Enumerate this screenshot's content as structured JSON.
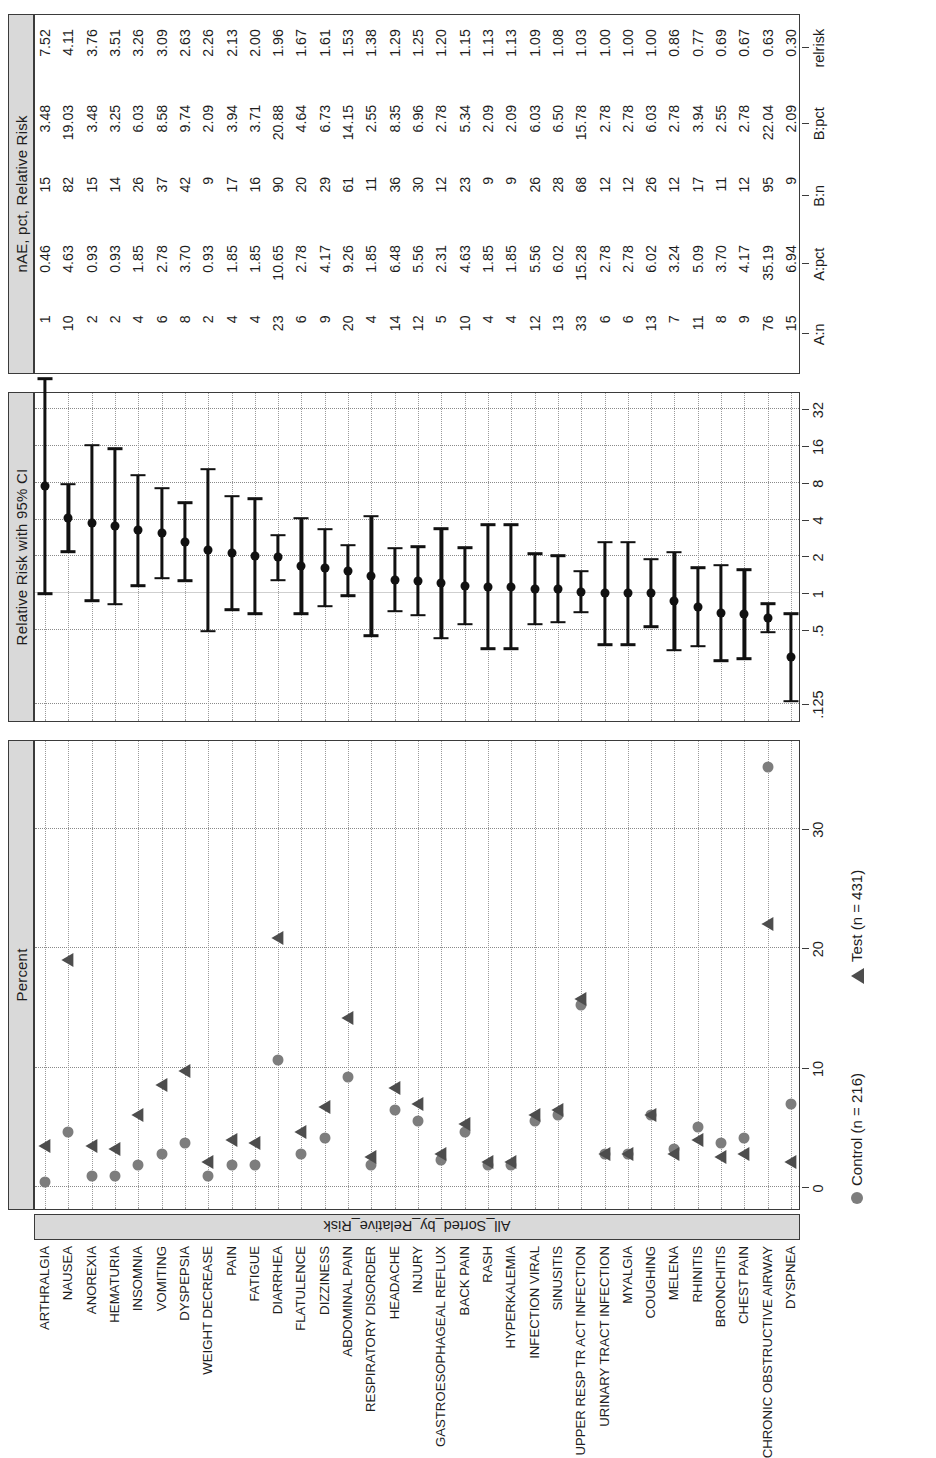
{
  "figure": {
    "panels": [
      {
        "id": "percent",
        "title": "Percent"
      },
      {
        "id": "relrisk",
        "title": "Relative Risk with 95% CI"
      },
      {
        "id": "table",
        "title": "nAE, pct, Relative Risk"
      }
    ],
    "strip_label": "All_Sorted_by_Relative_Risk",
    "legend": [
      {
        "symbol": "circle-marker",
        "label": "Control (n = 216)",
        "color": "#7d7d7d"
      },
      {
        "symbol": "triangle-marker",
        "label": "Test (n = 431)",
        "color": "#4d4d4d"
      }
    ]
  },
  "chart_data": {
    "type": "scatter",
    "title": "nAE, pct, Relative Risk",
    "panel_titles": [
      "Percent",
      "Relative Risk with 95% CI",
      "nAE, pct, Relative Risk"
    ],
    "ylabel": "All_Sorted_by_Relative_Risk",
    "legend": [
      "Control (n = 216)",
      "Test (n = 431)"
    ],
    "legend_position": "bottom-left",
    "grid": true,
    "percent_axis": {
      "label": "Percent",
      "ticks": [
        0,
        10,
        20,
        30
      ],
      "tick_labels": [
        "0",
        "10",
        "20",
        "30"
      ],
      "lim": [
        -1.5,
        37
      ]
    },
    "relrisk_axis": {
      "label": "Relative Risk with 95% CI",
      "scale": "log2",
      "ticks": [
        0.125,
        0.5,
        1,
        2,
        4,
        8,
        16,
        32
      ],
      "tick_labels": [
        ".125",
        ".5",
        "1",
        "2",
        "4",
        "8",
        "16",
        "32"
      ],
      "refline": 1
    },
    "table_headers": [
      "A:n",
      "A:pct",
      "B:n",
      "B:pct",
      "relrisk"
    ],
    "categories": [
      "ARTHRALGIA",
      "NAUSEA",
      "ANOREXIA",
      "HEMATURIA",
      "INSOMNIA",
      "VOMITING",
      "DYSPEPSIA",
      "WEIGHT DECREASE",
      "PAIN",
      "FATIGUE",
      "DIARRHEA",
      "FLATULENCE",
      "DIZZINESS",
      "ABDOMINAL PAIN",
      "RESPIRATORY DISORDER",
      "HEADACHE",
      "INJURY",
      "GASTROESOPHAGEAL REFLUX",
      "BACK PAIN",
      "RASH",
      "HYPERKALEMIA",
      "INFECTION VIRAL",
      "SINUSITIS",
      "UPPER RESP TR ACT INFECTION",
      "URINARY TRACT INFECTION",
      "MYALGIA",
      "COUGHING",
      "MELENA",
      "RHINITIS",
      "BRONCHITIS",
      "CHEST PAIN",
      "CHRONIC OBSTRUCTIVE AIRWAY",
      "DYSPNEA"
    ],
    "rows": [
      {
        "ae": "ARTHRALGIA",
        "a_n": 1,
        "a_pct": 0.46,
        "b_n": 15,
        "b_pct": 3.48,
        "relrisk": 7.52,
        "lcl": 0.99,
        "ucl": 56.6
      },
      {
        "ae": "NAUSEA",
        "a_n": 10,
        "a_pct": 4.63,
        "b_n": 82,
        "b_pct": 19.03,
        "relrisk": 4.11,
        "lcl": 2.18,
        "ucl": 7.75
      },
      {
        "ae": "ANOREXIA",
        "a_n": 2,
        "a_pct": 0.93,
        "b_n": 15,
        "b_pct": 3.48,
        "relrisk": 3.76,
        "lcl": 0.87,
        "ucl": 16.2
      },
      {
        "ae": "HEMATURIA",
        "a_n": 2,
        "a_pct": 0.93,
        "b_n": 14,
        "b_pct": 3.25,
        "relrisk": 3.51,
        "lcl": 0.81,
        "ucl": 15.2
      },
      {
        "ae": "INSOMNIA",
        "a_n": 4,
        "a_pct": 1.85,
        "b_n": 26,
        "b_pct": 6.03,
        "relrisk": 3.26,
        "lcl": 1.15,
        "ucl": 9.22
      },
      {
        "ae": "VOMITING",
        "a_n": 6,
        "a_pct": 2.78,
        "b_n": 37,
        "b_pct": 8.58,
        "relrisk": 3.09,
        "lcl": 1.32,
        "ucl": 7.21
      },
      {
        "ae": "DYSPEPSIA",
        "a_n": 8,
        "a_pct": 3.7,
        "b_n": 42,
        "b_pct": 9.74,
        "relrisk": 2.63,
        "lcl": 1.26,
        "ucl": 5.5
      },
      {
        "ae": "WEIGHT DECREASE",
        "a_n": 2,
        "a_pct": 0.93,
        "b_n": 9,
        "b_pct": 2.09,
        "relrisk": 2.26,
        "lcl": 0.49,
        "ucl": 10.3
      },
      {
        "ae": "PAIN",
        "a_n": 4,
        "a_pct": 1.85,
        "b_n": 17,
        "b_pct": 3.94,
        "relrisk": 2.13,
        "lcl": 0.73,
        "ucl": 6.22
      },
      {
        "ae": "FATIGUE",
        "a_n": 4,
        "a_pct": 1.85,
        "b_n": 16,
        "b_pct": 3.71,
        "relrisk": 2.0,
        "lcl": 0.68,
        "ucl": 5.9
      },
      {
        "ae": "DIARRHEA",
        "a_n": 23,
        "a_pct": 10.65,
        "b_n": 90,
        "b_pct": 20.88,
        "relrisk": 1.96,
        "lcl": 1.28,
        "ucl": 2.99
      },
      {
        "ae": "FLATULENCE",
        "a_n": 6,
        "a_pct": 2.78,
        "b_n": 20,
        "b_pct": 4.64,
        "relrisk": 1.67,
        "lcl": 0.68,
        "ucl": 4.1
      },
      {
        "ae": "DIZZINESS",
        "a_n": 9,
        "a_pct": 4.17,
        "b_n": 29,
        "b_pct": 6.73,
        "relrisk": 1.61,
        "lcl": 0.78,
        "ucl": 3.34
      },
      {
        "ae": "ABDOMINAL PAIN",
        "a_n": 20,
        "a_pct": 9.26,
        "b_n": 61,
        "b_pct": 14.15,
        "relrisk": 1.53,
        "lcl": 0.95,
        "ucl": 2.46
      },
      {
        "ae": "RESPIRATORY DISORDER",
        "a_n": 4,
        "a_pct": 1.85,
        "b_n": 11,
        "b_pct": 2.55,
        "relrisk": 1.38,
        "lcl": 0.45,
        "ucl": 4.26
      },
      {
        "ae": "HEADACHE",
        "a_n": 14,
        "a_pct": 6.48,
        "b_n": 36,
        "b_pct": 8.35,
        "relrisk": 1.29,
        "lcl": 0.71,
        "ucl": 2.33
      },
      {
        "ae": "INJURY",
        "a_n": 12,
        "a_pct": 5.56,
        "b_n": 30,
        "b_pct": 6.96,
        "relrisk": 1.25,
        "lcl": 0.66,
        "ucl": 2.39
      },
      {
        "ae": "GASTROESOPHAGEAL REFLUX",
        "a_n": 5,
        "a_pct": 2.31,
        "b_n": 12,
        "b_pct": 2.78,
        "relrisk": 1.2,
        "lcl": 0.43,
        "ucl": 3.36
      },
      {
        "ae": "BACK PAIN",
        "a_n": 10,
        "a_pct": 4.63,
        "b_n": 23,
        "b_pct": 5.34,
        "relrisk": 1.15,
        "lcl": 0.56,
        "ucl": 2.36
      },
      {
        "ae": "RASH",
        "a_n": 4,
        "a_pct": 1.85,
        "b_n": 9,
        "b_pct": 2.09,
        "relrisk": 1.13,
        "lcl": 0.35,
        "ucl": 3.62
      },
      {
        "ae": "HYPERKALEMIA",
        "a_n": 4,
        "a_pct": 1.85,
        "b_n": 9,
        "b_pct": 2.09,
        "relrisk": 1.13,
        "lcl": 0.35,
        "ucl": 3.62
      },
      {
        "ae": "INFECTION VIRAL",
        "a_n": 12,
        "a_pct": 5.56,
        "b_n": 26,
        "b_pct": 6.03,
        "relrisk": 1.09,
        "lcl": 0.56,
        "ucl": 2.1
      },
      {
        "ae": "SINUSITIS",
        "a_n": 13,
        "a_pct": 6.02,
        "b_n": 28,
        "b_pct": 6.5,
        "relrisk": 1.08,
        "lcl": 0.58,
        "ucl": 2.02
      },
      {
        "ae": "UPPER RESP TR ACT INFECTION",
        "a_n": 33,
        "a_pct": 15.28,
        "b_n": 68,
        "b_pct": 15.78,
        "relrisk": 1.03,
        "lcl": 0.7,
        "ucl": 1.52
      },
      {
        "ae": "URINARY TRACT INFECTION",
        "a_n": 6,
        "a_pct": 2.78,
        "b_n": 12,
        "b_pct": 2.78,
        "relrisk": 1.0,
        "lcl": 0.38,
        "ucl": 2.62
      },
      {
        "ae": "MYALGIA",
        "a_n": 6,
        "a_pct": 2.78,
        "b_n": 12,
        "b_pct": 2.78,
        "relrisk": 1.0,
        "lcl": 0.38,
        "ucl": 2.62
      },
      {
        "ae": "COUGHING",
        "a_n": 13,
        "a_pct": 6.02,
        "b_n": 26,
        "b_pct": 6.03,
        "relrisk": 1.0,
        "lcl": 0.53,
        "ucl": 1.89
      },
      {
        "ae": "MELENA",
        "a_n": 7,
        "a_pct": 3.24,
        "b_n": 12,
        "b_pct": 2.78,
        "relrisk": 0.86,
        "lcl": 0.34,
        "ucl": 2.15
      },
      {
        "ae": "RHINITIS",
        "a_n": 11,
        "a_pct": 5.09,
        "b_n": 17,
        "b_pct": 3.94,
        "relrisk": 0.77,
        "lcl": 0.37,
        "ucl": 1.62
      },
      {
        "ae": "BRONCHITIS",
        "a_n": 8,
        "a_pct": 3.7,
        "b_n": 11,
        "b_pct": 2.55,
        "relrisk": 0.69,
        "lcl": 0.28,
        "ucl": 1.69
      },
      {
        "ae": "CHEST PAIN",
        "a_n": 9,
        "a_pct": 4.17,
        "b_n": 12,
        "b_pct": 2.78,
        "relrisk": 0.67,
        "lcl": 0.29,
        "ucl": 1.55
      },
      {
        "ae": "CHRONIC OBSTRUCTIVE AIRWAY",
        "a_n": 76,
        "a_pct": 35.19,
        "b_n": 95,
        "b_pct": 22.04,
        "relrisk": 0.63,
        "lcl": 0.48,
        "ucl": 0.82
      },
      {
        "ae": "DYSPNEA",
        "a_n": 15,
        "a_pct": 6.94,
        "b_n": 9,
        "b_pct": 2.09,
        "relrisk": 0.3,
        "lcl": 0.13,
        "ucl": 0.68
      }
    ]
  }
}
